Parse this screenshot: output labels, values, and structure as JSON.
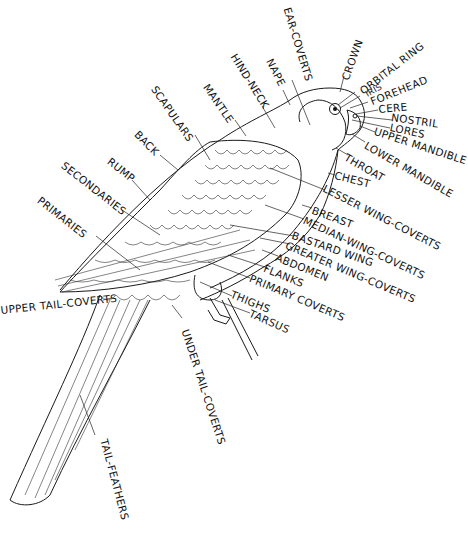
{
  "diagram": {
    "labels": {
      "ear_coverts": "EAR-COVERTS",
      "crown": "CROWN",
      "orbital_ring": "ORBITAL RING",
      "iris": "IRIS",
      "forehead": "FOREHEAD",
      "cere": "CERE",
      "nostril": "NOSTRIL",
      "lores": "LORES",
      "upper_mandible": "UPPER MANDIBLE",
      "lower_mandible": "LOWER MANDIBLE",
      "throat": "THROAT",
      "chest": "CHEST",
      "lesser_wing_coverts": "LESSER WING-COVERTS",
      "breast": "BREAST",
      "median_wing_coverts": "MEDIAN-WING-COVERTS",
      "bastard_wing": "BASTARD WING",
      "greater_wing_coverts": "GREATER WING-COVERTS",
      "abdomen": "ABDOMEN",
      "flanks": "FLANKS",
      "primary_coverts": "PRIMARY COVERTS",
      "thighs": "THIGHS",
      "tarsus": "TARSUS",
      "under_tail_coverts": "UNDER TAIL-COVERTS",
      "tail_feathers": "TAIL-FEATHERS",
      "upper_tail_coverts": "UPPER TAIL-COVERTS",
      "primaries": "PRIMARIES",
      "secondaries": "SECONDARIES",
      "rump": "RUMP",
      "back": "BACK",
      "scapulars": "SCAPULARS",
      "mantle": "MANTLE",
      "hind_neck": "HIND-NECK",
      "nape": "NAPE"
    }
  }
}
